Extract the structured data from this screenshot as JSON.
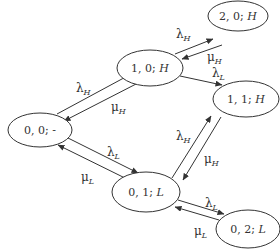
{
  "diagram": {
    "type": "state-transition-diagram",
    "nodes": [
      {
        "id": "n00",
        "label_main": "0, 0; ",
        "label_tail": "-",
        "tail_italic": false,
        "cx": 40,
        "cy": 130,
        "rx": 32,
        "ry": 17
      },
      {
        "id": "n10",
        "label_main": "1, 0; ",
        "label_tail": "H",
        "tail_italic": true,
        "cx": 150,
        "cy": 68,
        "rx": 33,
        "ry": 18
      },
      {
        "id": "n20",
        "label_main": "2, 0; ",
        "label_tail": "H",
        "tail_italic": true,
        "cx": 238,
        "cy": 16,
        "rx": 30,
        "ry": 15
      },
      {
        "id": "n11",
        "label_main": "1, 1; ",
        "label_tail": "H",
        "tail_italic": true,
        "cx": 246,
        "cy": 99,
        "rx": 33,
        "ry": 18
      },
      {
        "id": "n01",
        "label_main": "0, 1; ",
        "label_tail": "L",
        "tail_italic": true,
        "cx": 146,
        "cy": 192,
        "rx": 34,
        "ry": 20
      },
      {
        "id": "n02",
        "label_main": "0, 2; ",
        "label_tail": "L",
        "tail_italic": true,
        "cx": 248,
        "cy": 229,
        "rx": 32,
        "ry": 19
      }
    ],
    "edges": [
      {
        "from": "0, 0; -",
        "to": "1, 0; H",
        "label": "λ",
        "sub": "H"
      },
      {
        "from": "1, 0; H",
        "to": "0, 0; -",
        "label": "μ",
        "sub": "H"
      },
      {
        "from": "1, 0; H",
        "to": "2, 0; H",
        "label": "λ",
        "sub": "H"
      },
      {
        "from": "2, 0; H",
        "to": "1, 0; H",
        "label": "μ",
        "sub": "H"
      },
      {
        "from": "1, 0; H",
        "to": "1, 1; H",
        "label": "λ",
        "sub": "L"
      },
      {
        "from": "0, 1; L",
        "to": "1, 1; H",
        "label": "λ",
        "sub": "H"
      },
      {
        "from": "1, 1; H",
        "to": "0, 1; L",
        "label": "μ",
        "sub": "H"
      },
      {
        "from": "0, 0; -",
        "to": "0, 1; L",
        "label": "λ",
        "sub": "L"
      },
      {
        "from": "0, 1; L",
        "to": "0, 0; -",
        "label": "μ",
        "sub": "L"
      },
      {
        "from": "0, 1; L",
        "to": "0, 2; L",
        "label": "λ",
        "sub": "L"
      },
      {
        "from": "0, 2; L",
        "to": "0, 1; L",
        "label": "μ",
        "sub": "L"
      }
    ],
    "labels": {
      "n00_main": "0, 0; ",
      "n00_tail": "-",
      "n10_main": "1, 0; ",
      "n10_tail": "H",
      "n20_main": "2, 0; ",
      "n20_tail": "H",
      "n11_main": "1, 1; ",
      "n11_tail": "H",
      "n01_main": "0, 1; ",
      "n01_tail": "L",
      "n02_main": "0, 2; ",
      "n02_tail": "L",
      "lambda": "λ",
      "mu": "μ",
      "H": "H",
      "L": "L"
    },
    "stroke_color": "#333333",
    "background": "#ffffff"
  }
}
